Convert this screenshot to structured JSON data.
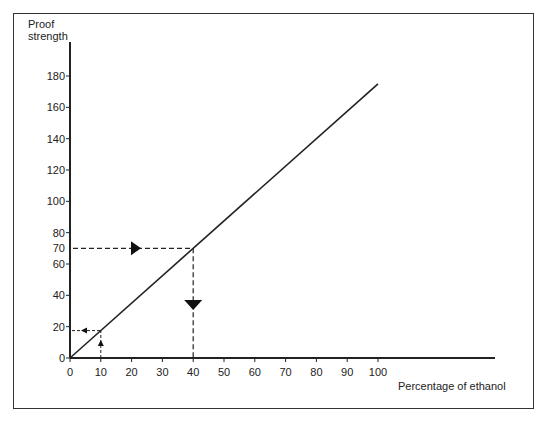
{
  "chart_data": {
    "type": "line",
    "title": "",
    "xlabel": "Percentage of ethanol",
    "ylabel": "Proof strength",
    "ylabel_lines": [
      "Proof",
      "strength"
    ],
    "xlim": [
      0,
      100
    ],
    "ylim": [
      0,
      180
    ],
    "x_ticks": [
      0,
      10,
      20,
      30,
      40,
      50,
      60,
      70,
      80,
      90,
      100
    ],
    "y_ticks": [
      0,
      20,
      40,
      60,
      80,
      100,
      120,
      140,
      160,
      180
    ],
    "y_extra_labels": [
      70
    ],
    "grid": false,
    "legend": null,
    "series": [
      {
        "name": "Proof strength vs percentage of ethanol",
        "x": [
          0,
          100
        ],
        "y": [
          0,
          175
        ]
      }
    ],
    "annotations": [
      {
        "type": "dashed-lookup",
        "from_axis": "y",
        "value_y": 70,
        "value_x": 40,
        "description": "70 proof → 40% ethanol (arrow right then down)"
      },
      {
        "type": "dashed-lookup",
        "from_axis": "x",
        "value_x": 10,
        "value_y": 17.5,
        "description": "10% ethanol → 17.5 proof (arrow up then left)"
      }
    ]
  }
}
